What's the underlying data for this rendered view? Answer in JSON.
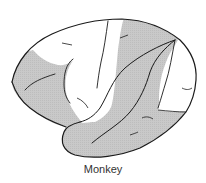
{
  "figure": {
    "caption": "Monkey",
    "colors": {
      "shaded": "#c6c6c6",
      "unshaded": "#ffffff",
      "outline": "#1a1a1a"
    }
  }
}
